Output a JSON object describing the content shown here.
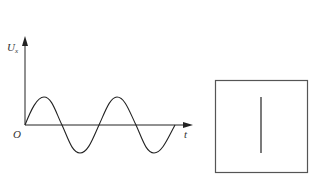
{
  "graph": {
    "y_axis_label": "U",
    "y_axis_subscript": "x",
    "x_axis_label": "t",
    "origin_label": "O",
    "curve": "sine wave, two full periods starting at origin going up"
  },
  "screen": {
    "description": "square screen showing a vertical line"
  }
}
